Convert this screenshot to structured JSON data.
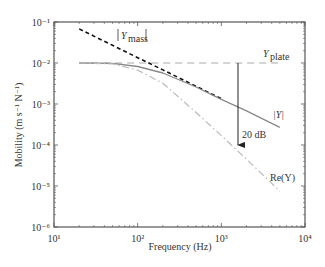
{
  "chart_data": {
    "type": "line",
    "title": "",
    "xlabel": "Frequency (Hz)",
    "ylabel": "Mobility (m s⁻¹ N⁻¹)",
    "xscale": "log",
    "yscale": "log",
    "xlim": [
      10,
      10000
    ],
    "ylim": [
      1e-06,
      0.1
    ],
    "grid": false,
    "x_ticks": [
      "10¹",
      "10²",
      "10³",
      "10⁴"
    ],
    "y_ticks": [
      "10⁻¹",
      "10⁻²",
      "10⁻³",
      "10⁻⁴",
      "10⁻⁵",
      "10⁻⁶"
    ],
    "series": [
      {
        "name": "|Y_mass|",
        "style": "dashed-black",
        "x": [
          20,
          50,
          100,
          200,
          500,
          1000
        ],
        "y": [
          0.068,
          0.027,
          0.0135,
          0.0068,
          0.0027,
          0.00135
        ]
      },
      {
        "name": "Y_plate",
        "style": "dashed-gray",
        "x": [
          20,
          5000
        ],
        "y": [
          0.01,
          0.01
        ]
      },
      {
        "name": "|Y|",
        "style": "solid-gray",
        "x": [
          20,
          50,
          100,
          200,
          500,
          1000,
          2000,
          5000
        ],
        "y": [
          0.01,
          0.0098,
          0.0082,
          0.0057,
          0.0026,
          0.0013,
          0.00068,
          0.00027
        ]
      },
      {
        "name": "Re(Y)",
        "style": "dashdot-lightgray",
        "x": [
          20,
          50,
          100,
          200,
          500,
          1000,
          2000,
          5000
        ],
        "y": [
          0.01,
          0.0095,
          0.0067,
          0.0032,
          0.00062,
          0.00017,
          4.5e-05,
          7.5e-06
        ]
      }
    ],
    "annotations": [
      {
        "text": "|Y_mass|",
        "x": 120,
        "y": 0.05
      },
      {
        "text": "Y_plate",
        "x": 3200,
        "y": 0.013
      },
      {
        "text": "|Y|",
        "x": 3500,
        "y": 0.00045
      },
      {
        "text": "Re(Y)",
        "x": 3300,
        "y": 1.2e-05
      },
      {
        "text": "20 dB",
        "arrow_from": [
          1500,
          0.01
        ],
        "arrow_to": [
          1500,
          0.0001
        ]
      }
    ]
  },
  "labels": {
    "xlabel": "Frequency (Hz)",
    "ylabel": "Mobility (m s⁻¹ N⁻¹)",
    "ymass_sym": "Y",
    "ymass_sub": "mass",
    "yplate_sym": "Y",
    "yplate_sub": "plate",
    "y_abs": "|Y|",
    "re_y": "Re(Y)",
    "db": "20 dB"
  }
}
